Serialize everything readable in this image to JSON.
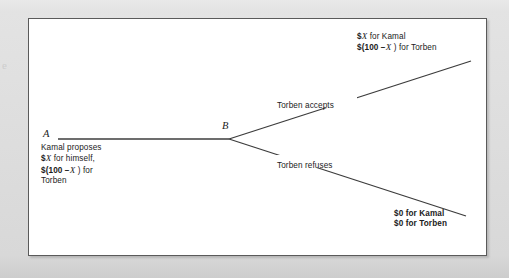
{
  "figure": {
    "type": "extensive-form game tree",
    "background_color": "#d8d8d8",
    "frame_color": "#5a5a5a",
    "paper_color": "#ffffff",
    "line_color": "#3c3c3c",
    "text_color": "#1b1b1b",
    "edge_mark": "e"
  },
  "nodes": [
    {
      "id": "A",
      "label": "A",
      "x": 17,
      "y": 120,
      "player": "Kamal"
    },
    {
      "id": "B",
      "label": "B",
      "x": 200,
      "y": 120,
      "player": "Torben"
    }
  ],
  "branch_labels": {
    "accepts": "Torben accepts",
    "refuses": "Torben refuses"
  },
  "proposal": {
    "line1": "Kamal proposes",
    "line2_prefix": "$",
    "line2_var": "X",
    "line2_suffix": " for himself,",
    "line3_prefix": "$(100 −",
    "line3_var": "X",
    "line3_suffix": " ) for",
    "line4": "Torben"
  },
  "payoff_top": {
    "line1_prefix": "$",
    "line1_var": "X",
    "line1_suffix": " for Kamal",
    "line2_prefix": "$(100 −",
    "line2_var": "X",
    "line2_suffix": " ) for Torben"
  },
  "payoff_bottom": {
    "line1": "$0 for Kamal",
    "line2": "$0 for Torben"
  }
}
